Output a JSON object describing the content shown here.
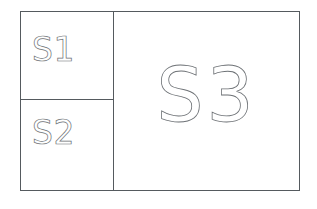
{
  "diagram": {
    "title": "",
    "background_color": "#ffffff",
    "border_color": "#555a5e",
    "label_stroke_color": "#6e7276",
    "regions": [
      {
        "id": "s1",
        "label": "S1",
        "position": "top-left",
        "size": "small"
      },
      {
        "id": "s2",
        "label": "S2",
        "position": "bottom-left",
        "size": "small"
      },
      {
        "id": "s3",
        "label": "S3",
        "position": "right",
        "size": "large"
      }
    ]
  }
}
